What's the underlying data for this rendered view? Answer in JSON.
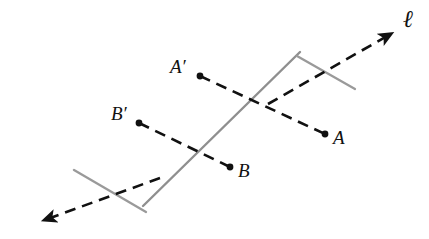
{
  "figure": {
    "background_color": "#ffffff",
    "width": 429,
    "height": 239
  },
  "colors": {
    "line_gray": "#8f8f8f",
    "tick_gray": "#9a9a9a",
    "dash_black": "#111111",
    "point_black": "#111111",
    "label_black": "#111111"
  },
  "line": {
    "name": "ℓ",
    "label": "ℓ",
    "label_pos": {
      "x": 403,
      "y": 7
    },
    "stroke_color": "#8f8f8f",
    "stroke_width": 2.4,
    "endpoints": {
      "x1": 300,
      "y1": 52,
      "x2": 143,
      "y2": 206
    },
    "ticks": [
      {
        "name": "tick-upper-right",
        "x1": 297,
        "y1": 56,
        "x2": 355,
        "y2": 89
      },
      {
        "name": "tick-lower-left",
        "x1": 74,
        "y1": 170,
        "x2": 146,
        "y2": 212
      }
    ]
  },
  "direction_arrows": [
    {
      "name": "arrow-upper-right",
      "from": {
        "x": 268,
        "y": 104
      },
      "to": {
        "x": 396,
        "y": 31
      },
      "label": "ℓ",
      "dashed": true
    },
    {
      "name": "arrow-lower-left",
      "from": {
        "x": 160,
        "y": 178
      },
      "to": {
        "x": 39,
        "y": 222
      },
      "dashed": true
    }
  ],
  "points": [
    {
      "id": "A-prime",
      "label": "A′",
      "dot": {
        "x": 200,
        "y": 76
      },
      "label_pos": {
        "x": 170,
        "y": 57
      },
      "radius": 3.4
    },
    {
      "id": "A",
      "label": "A",
      "dot": {
        "x": 325,
        "y": 134
      },
      "label_pos": {
        "x": 333,
        "y": 128
      },
      "radius": 3.4
    },
    {
      "id": "B-prime",
      "label": "B′",
      "dot": {
        "x": 139,
        "y": 123
      },
      "label_pos": {
        "x": 111,
        "y": 104
      },
      "radius": 3.4
    },
    {
      "id": "B",
      "label": "B",
      "dot": {
        "x": 230,
        "y": 167
      },
      "label_pos": {
        "x": 238,
        "y": 161
      },
      "radius": 3.4
    }
  ],
  "segments": [
    {
      "id": "segment-A-prime-A",
      "from_point": "A-prime",
      "to_point": "A",
      "style": "dashed",
      "stroke_color": "#111111",
      "stroke_width": 2.6,
      "dash_pattern": "11 7",
      "crosses_line_at": {
        "x": 265,
        "y": 106
      }
    },
    {
      "id": "segment-B-prime-B",
      "from_point": "B-prime",
      "to_point": "B",
      "style": "dashed",
      "stroke_color": "#111111",
      "stroke_width": 2.6,
      "dash_pattern": "11 7",
      "crosses_line_at": {
        "x": 189,
        "y": 147
      }
    }
  ]
}
